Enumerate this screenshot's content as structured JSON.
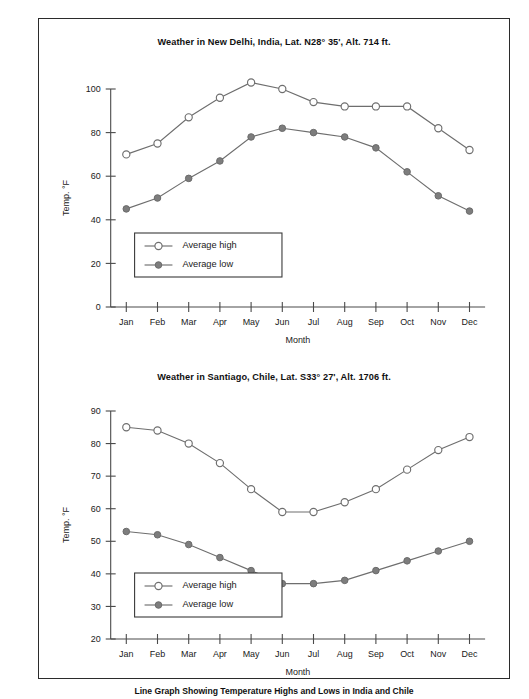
{
  "figure": {
    "caption": "Line Graph Showing Temperature Highs and Lows in India and Chile"
  },
  "charts": [
    {
      "id": "new-delhi",
      "title": "Weather in New Delhi, India, Lat. N28° 35', Alt. 714 ft.",
      "xlabel": "Month",
      "ylabel": "Temp. °F",
      "legend": {
        "high": "Average high",
        "low": "Average low"
      }
    },
    {
      "id": "santiago",
      "title": "Weather in Santiago, Chile, Lat. S33° 27', Alt. 1706 ft.",
      "xlabel": "Month",
      "ylabel": "Temp. °F",
      "legend": {
        "high": "Average high",
        "low": "Average low"
      }
    }
  ],
  "chart_data": [
    {
      "type": "line",
      "title": "Weather in New Delhi, India, Lat. N28° 35', Alt. 714 ft.",
      "xlabel": "Month",
      "ylabel": "Temp. °F",
      "categories": [
        "Jan",
        "Feb",
        "Mar",
        "Apr",
        "May",
        "Jun",
        "Jul",
        "Aug",
        "Sep",
        "Oct",
        "Nov",
        "Dec"
      ],
      "series": [
        {
          "name": "Average high",
          "values": [
            70,
            75,
            87,
            96,
            103,
            100,
            94,
            92,
            92,
            92,
            82,
            72
          ]
        },
        {
          "name": "Average low",
          "values": [
            45,
            50,
            59,
            67,
            78,
            82,
            80,
            78,
            73,
            62,
            51,
            44
          ]
        }
      ],
      "ylim": [
        0,
        100
      ],
      "yticks": [
        0,
        20,
        40,
        60,
        80,
        100
      ],
      "grid": false,
      "legend_position": "inside-lower-left"
    },
    {
      "type": "line",
      "title": "Weather in Santiago, Chile, Lat. S33° 27', Alt. 1706 ft.",
      "xlabel": "Month",
      "ylabel": "Temp. °F",
      "categories": [
        "Jan",
        "Feb",
        "Mar",
        "Apr",
        "May",
        "Jun",
        "Jul",
        "Aug",
        "Sep",
        "Oct",
        "Nov",
        "Dec"
      ],
      "series": [
        {
          "name": "Average high",
          "values": [
            85,
            84,
            80,
            74,
            66,
            59,
            59,
            62,
            66,
            72,
            78,
            82
          ]
        },
        {
          "name": "Average low",
          "values": [
            53,
            52,
            49,
            45,
            41,
            37,
            37,
            38,
            41,
            44,
            47,
            50
          ]
        }
      ],
      "ylim": [
        20,
        90
      ],
      "yticks": [
        20,
        30,
        40,
        50,
        60,
        70,
        80,
        90
      ],
      "grid": false,
      "legend_position": "inside-lower-left"
    }
  ],
  "colors": {
    "line": "#6e6e6e",
    "marker_low_fill": "#7d7d7d",
    "marker_high_fill": "#ffffff",
    "axis": "#4a4a4a",
    "frame": "#2b2b2b",
    "text": "#1a1a1a"
  }
}
